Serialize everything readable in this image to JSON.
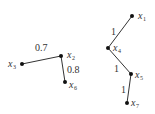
{
  "graphs": [
    {
      "name": "left-tree",
      "nodes": [
        {
          "id": "x3",
          "var": "x",
          "sub": "3",
          "x": 22,
          "y": 64,
          "lx": 8,
          "ly": 67
        },
        {
          "id": "x2",
          "var": "x",
          "sub": "2",
          "x": 61,
          "y": 56,
          "lx": 68,
          "ly": 58
        },
        {
          "id": "x6",
          "var": "x",
          "sub": "6",
          "x": 65,
          "y": 82,
          "lx": 70,
          "ly": 87
        }
      ],
      "edges": [
        {
          "from": "x3",
          "to": "x2",
          "weight": "0.7",
          "lx": 35,
          "ly": 51
        },
        {
          "from": "x2",
          "to": "x6",
          "weight": "0.8",
          "lx": 67,
          "ly": 73
        }
      ]
    },
    {
      "name": "right-tree",
      "nodes": [
        {
          "id": "x1",
          "var": "x",
          "sub": "1",
          "x": 132,
          "y": 16,
          "lx": 138,
          "ly": 19
        },
        {
          "id": "x4",
          "var": "x",
          "sub": "4",
          "x": 108,
          "y": 48,
          "lx": 114,
          "ly": 52
        },
        {
          "id": "x5",
          "var": "x",
          "sub": "5",
          "x": 131,
          "y": 74,
          "lx": 136,
          "ly": 79
        },
        {
          "id": "x7",
          "var": "x",
          "sub": "7",
          "x": 127,
          "y": 103,
          "lx": 132,
          "ly": 107
        }
      ],
      "edges": [
        {
          "from": "x1",
          "to": "x4",
          "weight": "1",
          "lx": 111,
          "ly": 35
        },
        {
          "from": "x4",
          "to": "x5",
          "weight": "1",
          "lx": 114,
          "ly": 72
        },
        {
          "from": "x5",
          "to": "x7",
          "weight": "1",
          "lx": 121,
          "ly": 93
        }
      ]
    }
  ],
  "texts": {
    "w_x3_x2": "0.7",
    "w_x2_x6": "0.8",
    "w_x1_x4": "1",
    "w_x4_x5": "1",
    "w_x5_x7": "1",
    "var": "x",
    "s1": "1",
    "s2": "2",
    "s3": "3",
    "s4": "4",
    "s5": "5",
    "s6": "6",
    "s7": "7"
  }
}
